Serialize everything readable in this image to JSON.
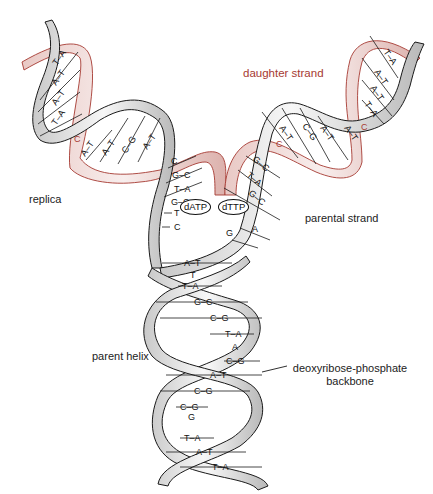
{
  "colors": {
    "parental_strand": "#1a1a1a",
    "daughter_strand": "#a63a32",
    "ribbon_fill": "#f2f2f2",
    "ribbon_shade": "#bdbdbd",
    "daughter_fill": "#f0dcda"
  },
  "labels": {
    "daughter_strand": "daughter strand",
    "replica": "replica",
    "parental_strand": "parental strand",
    "parent_helix": "parent helix",
    "backbone_line1": "deoxyribose-phosphate",
    "backbone_line2": "backbone"
  },
  "nucleotides": {
    "free1": "dATP",
    "free2": "dTTP"
  },
  "left_replica": {
    "pairs": [
      "T–A",
      "A–T",
      "A–T",
      "T–A",
      "A–T",
      "A–T",
      "C–G",
      "A–T"
    ],
    "new_bases": [
      "C"
    ]
  },
  "right_replica": {
    "pairs": [
      "T–A",
      "A–T",
      "A–T",
      "T–A",
      "A–T",
      "C–G",
      "A–T",
      "A–T"
    ],
    "new_bases": [
      "C",
      "C"
    ]
  },
  "fork_left": [
    "C",
    "G–C",
    "T–A",
    "G–C",
    "T",
    "C"
  ],
  "fork_right": [
    "G–C",
    "T–A",
    "G–C",
    "A",
    "G"
  ],
  "parent_helix": {
    "pairs": [
      "A–T",
      "T",
      "T–A",
      "G–C",
      "C–G",
      "T–A",
      "A",
      "C–G",
      "A–T",
      "C–G",
      "C–G",
      "G",
      "T–A",
      "A–T",
      "T–A"
    ]
  }
}
